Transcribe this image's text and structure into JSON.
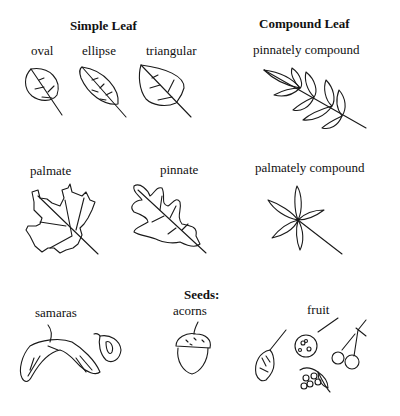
{
  "sections": {
    "simple_leaf": {
      "title": "Simple Leaf",
      "items": [
        {
          "label": "oval"
        },
        {
          "label": "ellipse"
        },
        {
          "label": "triangular"
        },
        {
          "label": "palmate"
        },
        {
          "label": "pinnate"
        }
      ]
    },
    "compound_leaf": {
      "title": "Compound Leaf",
      "items": [
        {
          "label": "pinnately compound"
        },
        {
          "label": "palmately compound"
        }
      ]
    },
    "seeds": {
      "title": "Seeds:",
      "items": [
        {
          "label": "samaras"
        },
        {
          "label": "acorns"
        },
        {
          "label": "fruit"
        }
      ]
    }
  }
}
